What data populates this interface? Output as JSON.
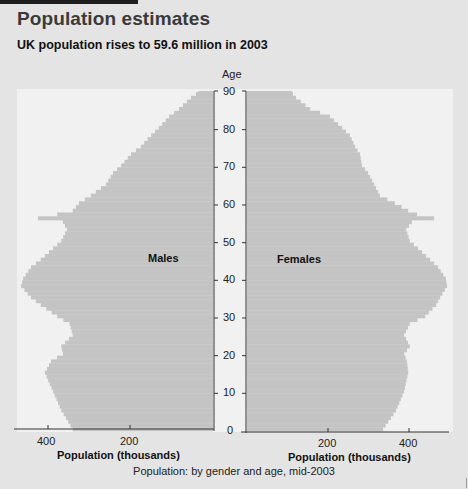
{
  "header": {
    "title": "Population estimates",
    "subtitle": "UK population rises to 59.6 million in 2003"
  },
  "caption": "Population: by gender and age, mid-2003",
  "colors": {
    "background": "#e4e4e4",
    "plot_area": "#f1f1f1",
    "bars": "#c4c4c4",
    "axis": "#333333",
    "topbar": "#1e1e1e"
  },
  "labels": {
    "age_axis_title": "Age",
    "males": "Males",
    "females": "Females",
    "x_axis_title_left": "Population (thousands)",
    "x_axis_title_right": "Population (thousands)",
    "age_ticks": [
      "0",
      "10",
      "20",
      "30",
      "40",
      "50",
      "60",
      "70",
      "80",
      "90"
    ],
    "male_ticks": [
      "400",
      "200"
    ],
    "female_ticks": [
      "200",
      "400"
    ]
  },
  "chart_data": {
    "type": "bar",
    "subtype": "population-pyramid",
    "title": "UK population rises to 59.6 million in 2003",
    "caption": "Population: by gender and age, mid-2003",
    "ylabel": "Age",
    "xlabel": "Population (thousands)",
    "ylim": [
      0,
      90
    ],
    "xlim": [
      0,
      500
    ],
    "y_ticks": [
      0,
      10,
      20,
      30,
      40,
      50,
      60,
      70,
      80,
      90
    ],
    "x_ticks": [
      200,
      400
    ],
    "grid": false,
    "legend": "inline labels (Males left, Females right)",
    "ages": [
      0,
      5,
      10,
      15,
      18,
      20,
      22,
      25,
      28,
      30,
      33,
      35,
      38,
      40,
      43,
      45,
      48,
      50,
      53,
      55,
      56,
      57,
      58,
      60,
      62,
      65,
      68,
      70,
      73,
      75,
      78,
      80,
      83,
      85,
      88,
      90
    ],
    "series": [
      {
        "name": "Males",
        "side": "left",
        "values": [
          342,
          370,
          390,
          410,
          395,
          366,
          370,
          342,
          350,
          380,
          420,
          444,
          468,
          463,
          444,
          420,
          390,
          370,
          356,
          366,
          427,
          380,
          342,
          327,
          298,
          261,
          244,
          224,
          200,
          176,
          151,
          132,
          107,
          83,
          54,
          29
        ]
      },
      {
        "name": "Females",
        "side": "right",
        "values": [
          336,
          368,
          388,
          398,
          395,
          388,
          402,
          388,
          402,
          440,
          467,
          477,
          494,
          491,
          472,
          452,
          422,
          402,
          393,
          407,
          462,
          420,
          398,
          365,
          328,
          314,
          299,
          284,
          279,
          267,
          254,
          235,
          205,
          156,
          121,
          106
        ]
      }
    ]
  }
}
